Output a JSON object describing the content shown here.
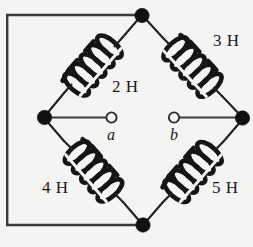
{
  "figure": {
    "kind": "inductor-bridge-circuit",
    "background_color": "#f4f4f2",
    "wire_color": "#231f20"
  },
  "components": [
    {
      "id": "L2",
      "label": "2 H",
      "value": 2,
      "unit": "H",
      "position": "top-left-branch"
    },
    {
      "id": "L3",
      "label": "3 H",
      "value": 3,
      "unit": "H",
      "position": "top-right-branch"
    },
    {
      "id": "L4",
      "label": "4 H",
      "value": 4,
      "unit": "H",
      "position": "bottom-left-branch"
    },
    {
      "id": "L5",
      "label": "5 H",
      "value": 5,
      "unit": "H",
      "position": "bottom-right-branch"
    }
  ],
  "terminals": [
    {
      "id": "a",
      "label": "a"
    },
    {
      "id": "b",
      "label": "b"
    }
  ],
  "nodes": [
    {
      "id": "top",
      "type": "junction"
    },
    {
      "id": "left",
      "type": "junction"
    },
    {
      "id": "right",
      "type": "junction"
    },
    {
      "id": "bottom",
      "type": "junction"
    }
  ]
}
